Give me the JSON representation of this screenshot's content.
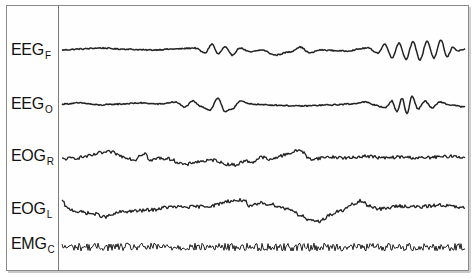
{
  "figure": {
    "frame_color": "#8a8a8a",
    "trace_color": "#222222",
    "channels": [
      {
        "id": "eegf",
        "base": "EEG",
        "sub": "F",
        "label_y": 42,
        "y": 50,
        "keys": [
          [
            62,
            0
          ],
          [
            80,
            1
          ],
          [
            100,
            2
          ],
          [
            120,
            1
          ],
          [
            150,
            0
          ],
          [
            175,
            1
          ],
          [
            195,
            2
          ],
          [
            205,
            -3
          ],
          [
            212,
            6
          ],
          [
            218,
            -4
          ],
          [
            225,
            3
          ],
          [
            232,
            -5
          ],
          [
            240,
            2
          ],
          [
            250,
            -2
          ],
          [
            262,
            0
          ],
          [
            275,
            -5
          ],
          [
            290,
            -2
          ],
          [
            300,
            3
          ],
          [
            310,
            -3
          ],
          [
            320,
            0
          ],
          [
            345,
            -1
          ],
          [
            368,
            2
          ],
          [
            378,
            -3
          ],
          [
            385,
            6
          ],
          [
            392,
            -8
          ],
          [
            399,
            7
          ],
          [
            406,
            -9
          ],
          [
            413,
            8
          ],
          [
            420,
            -10
          ],
          [
            427,
            9
          ],
          [
            434,
            -8
          ],
          [
            441,
            10
          ],
          [
            447,
            -7
          ],
          [
            453,
            3
          ],
          [
            458,
            -1
          ],
          [
            465,
            1
          ]
        ],
        "noise": 0.6
      },
      {
        "id": "eego",
        "base": "EEG",
        "sub": "O",
        "label_y": 96,
        "y": 104,
        "keys": [
          [
            62,
            0
          ],
          [
            80,
            1
          ],
          [
            100,
            -1
          ],
          [
            120,
            0
          ],
          [
            140,
            1
          ],
          [
            160,
            0
          ],
          [
            175,
            2
          ],
          [
            185,
            -3
          ],
          [
            193,
            3
          ],
          [
            200,
            -2
          ],
          [
            210,
            -6
          ],
          [
            218,
            6
          ],
          [
            225,
            -8
          ],
          [
            232,
            -5
          ],
          [
            240,
            3
          ],
          [
            250,
            0
          ],
          [
            270,
            -1
          ],
          [
            300,
            -2
          ],
          [
            330,
            -1
          ],
          [
            350,
            0
          ],
          [
            365,
            2
          ],
          [
            375,
            -1
          ],
          [
            385,
            -4
          ],
          [
            392,
            3
          ],
          [
            397,
            -8
          ],
          [
            402,
            6
          ],
          [
            407,
            -10
          ],
          [
            412,
            8
          ],
          [
            418,
            -5
          ],
          [
            425,
            3
          ],
          [
            432,
            -4
          ],
          [
            440,
            2
          ],
          [
            450,
            -1
          ],
          [
            465,
            -3
          ]
        ],
        "noise": 0.6
      },
      {
        "id": "eogr",
        "base": "EOG",
        "sub": "R",
        "label_y": 148,
        "y": 156,
        "keys": [
          [
            62,
            -3
          ],
          [
            75,
            -2
          ],
          [
            90,
            0
          ],
          [
            100,
            3
          ],
          [
            110,
            4
          ],
          [
            125,
            -1
          ],
          [
            135,
            -4
          ],
          [
            140,
            1
          ],
          [
            145,
            3
          ],
          [
            150,
            -5
          ],
          [
            158,
            -2
          ],
          [
            170,
            -3
          ],
          [
            180,
            -7
          ],
          [
            185,
            -9
          ],
          [
            195,
            -6
          ],
          [
            205,
            -5
          ],
          [
            215,
            -4
          ],
          [
            225,
            -8
          ],
          [
            235,
            -9
          ],
          [
            245,
            -5
          ],
          [
            252,
            -6
          ],
          [
            262,
            -1
          ],
          [
            270,
            -4
          ],
          [
            280,
            0
          ],
          [
            290,
            3
          ],
          [
            300,
            6
          ],
          [
            310,
            -3
          ],
          [
            330,
            -1
          ],
          [
            350,
            -2
          ],
          [
            365,
            0
          ],
          [
            385,
            -2
          ],
          [
            400,
            -1
          ],
          [
            420,
            -2
          ],
          [
            440,
            -1
          ],
          [
            455,
            0
          ],
          [
            465,
            -2
          ]
        ],
        "noise": 1.6
      },
      {
        "id": "eogl",
        "base": "EOG",
        "sub": "L",
        "label_y": 201,
        "y": 209,
        "keys": [
          [
            62,
            8
          ],
          [
            68,
            0
          ],
          [
            80,
            -3
          ],
          [
            95,
            -5
          ],
          [
            105,
            -8
          ],
          [
            112,
            -6
          ],
          [
            120,
            -3
          ],
          [
            135,
            -2
          ],
          [
            150,
            -1
          ],
          [
            170,
            2
          ],
          [
            190,
            2
          ],
          [
            210,
            3
          ],
          [
            230,
            8
          ],
          [
            245,
            9
          ],
          [
            248,
            2
          ],
          [
            262,
            6
          ],
          [
            268,
            5
          ],
          [
            290,
            0
          ],
          [
            300,
            -6
          ],
          [
            310,
            -12
          ],
          [
            320,
            -12
          ],
          [
            330,
            -6
          ],
          [
            340,
            -2
          ],
          [
            355,
            5
          ],
          [
            360,
            8
          ],
          [
            370,
            3
          ],
          [
            380,
            0
          ],
          [
            400,
            3
          ],
          [
            420,
            2
          ],
          [
            440,
            4
          ],
          [
            465,
            1
          ]
        ],
        "noise": 1.7
      },
      {
        "id": "emgc",
        "base": "EMG",
        "sub": "C",
        "label_y": 244,
        "y": 247,
        "keys": [
          [
            62,
            0
          ],
          [
            465,
            0
          ]
        ],
        "noise": 4.0
      }
    ]
  }
}
